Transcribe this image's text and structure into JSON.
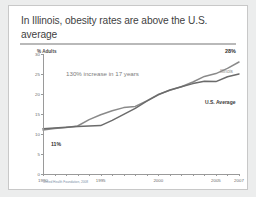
{
  "slide": {
    "title": "In Illinois, obesity rates are above the U.S. average",
    "footnote": "United Health Foundation, 2008"
  },
  "chart_data": {
    "type": "line",
    "title": "In Illinois, obesity rates are above the U.S. average",
    "xlabel": "",
    "ylabel": "% Adults",
    "ylim": [
      0,
      30
    ],
    "xlim": [
      1990,
      2007
    ],
    "grid": false,
    "legend_position": "right-inline",
    "yticks": [
      "0",
      "5",
      "10",
      "15",
      "20",
      "25",
      "30"
    ],
    "ytick_values": [
      0,
      5,
      10,
      15,
      20,
      25,
      30
    ],
    "xticks": [
      "1990",
      "1995",
      "2000",
      "2005",
      "2007"
    ],
    "xtick_values": [
      1990,
      1995,
      2000,
      2005,
      2007
    ],
    "x": [
      1990,
      1991,
      1992,
      1993,
      1994,
      1995,
      1996,
      1997,
      1998,
      1999,
      2000,
      2001,
      2002,
      2003,
      2004,
      2005,
      2006,
      2007
    ],
    "series": [
      {
        "name": "Illinois",
        "color": "#8a8a8a",
        "values": [
          11.0,
          11.4,
          11.6,
          12.0,
          13.6,
          14.8,
          15.8,
          16.6,
          16.9,
          18.3,
          19.9,
          20.9,
          21.8,
          23.0,
          24.4,
          25.1,
          26.4,
          28.0
        ]
      },
      {
        "name": "U.S. Average",
        "color": "#6b6b6b",
        "values": [
          11.3,
          11.5,
          11.7,
          11.9,
          12.0,
          12.1,
          13.4,
          14.9,
          16.4,
          18.2,
          19.8,
          21.0,
          21.8,
          22.6,
          23.2,
          23.1,
          24.3,
          25.0
        ]
      }
    ],
    "annotations": [
      {
        "text": "130% increase in 17 years",
        "color": "#7d7d7d"
      },
      {
        "text": "11%",
        "x": 1990,
        "y": 11.0
      },
      {
        "text": "28%",
        "x": 2007,
        "y": 28.0
      }
    ]
  }
}
